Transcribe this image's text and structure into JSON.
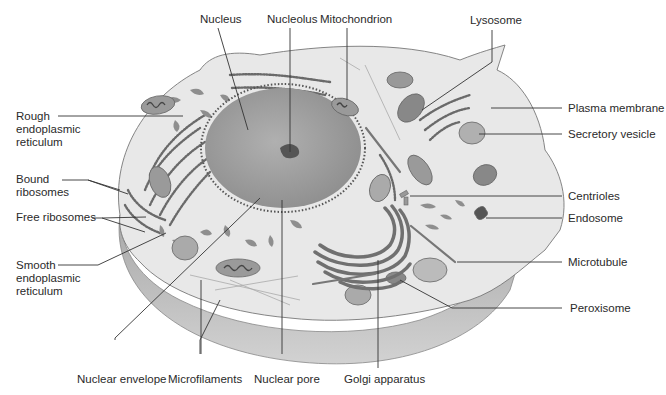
{
  "diagram": {
    "colors": {
      "cytoplasm": "#e9e9e9",
      "cell_side": "#b9b9b9",
      "nucleus": "#9a9a9a",
      "nucleolus": "#555555",
      "organelle": "#8c8c8c",
      "leader_line": "#333333",
      "label_text": "#2a2a2a"
    },
    "labels": {
      "nucleus": "Nucleus",
      "nucleolus": "Nucleolus",
      "mitochondrion": "Mitochondrion",
      "lysosome": "Lysosome",
      "rough_er": [
        "Rough",
        "endoplasmic",
        "reticulum"
      ],
      "bound_ribosomes": [
        "Bound",
        "ribosomes"
      ],
      "free_ribosomes": "Free ribosomes",
      "smooth_er": [
        "Smooth",
        "endoplasmic",
        "reticulum"
      ],
      "plasma_membrane": "Plasma membrane",
      "secretory_vesicle": "Secretory vesicle",
      "centrioles": "Centrioles",
      "endosome": "Endosome",
      "microtubule": "Microtubule",
      "peroxisome": "Peroxisome",
      "nuclear_envelope": "Nuclear envelope",
      "microfilaments": "Microfilaments",
      "nuclear_pore": "Nuclear pore",
      "golgi_apparatus": "Golgi apparatus"
    }
  }
}
